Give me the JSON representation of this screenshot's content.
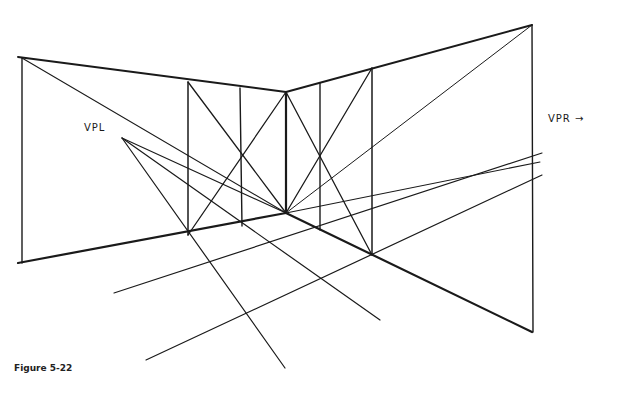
{
  "figure": {
    "caption": "Figure 5-22",
    "labels": {
      "vpl": "VPL",
      "vpr": "VPR →"
    },
    "ink_color": "#1a1a1a",
    "background": "#ffffff"
  }
}
